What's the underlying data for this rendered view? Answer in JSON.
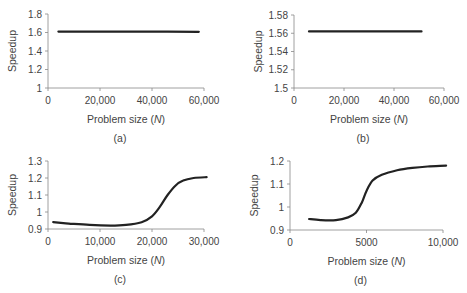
{
  "chart_data": [
    {
      "id": "a",
      "type": "line",
      "panel_label": "(a)",
      "title": "",
      "xlabel": "Problem size (N)",
      "ylabel": "Speedup",
      "xlim": [
        0,
        60000
      ],
      "ylim": [
        1,
        1.8
      ],
      "xticks": [
        0,
        20000,
        40000,
        60000
      ],
      "xtick_labels": [
        "0",
        "20,000",
        "40,000",
        "60,000"
      ],
      "yticks": [
        1,
        1.2,
        1.4,
        1.6,
        1.8
      ],
      "ytick_labels": [
        "1",
        "1.2",
        "1.4",
        "1.6",
        "1.8"
      ],
      "grid": false,
      "series": [
        {
          "name": "Speedup",
          "x": [
            4000,
            20000,
            40000,
            58000
          ],
          "y": [
            1.61,
            1.61,
            1.61,
            1.608
          ]
        }
      ],
      "box": {
        "left": 48,
        "top": 14,
        "width": 156,
        "height": 74
      }
    },
    {
      "id": "b",
      "type": "line",
      "panel_label": "(b)",
      "title": "",
      "xlabel": "Problem size (N)",
      "ylabel": "Speedup",
      "xlim": [
        0,
        60000
      ],
      "ylim": [
        1.5,
        1.58
      ],
      "xticks": [
        0,
        20000,
        40000,
        60000
      ],
      "xtick_labels": [
        "0",
        "20,000",
        "40,000",
        "60,000"
      ],
      "yticks": [
        1.5,
        1.52,
        1.54,
        1.56,
        1.58
      ],
      "ytick_labels": [
        "1.5",
        "1.52",
        "1.54",
        "1.56",
        "1.58"
      ],
      "grid": false,
      "series": [
        {
          "name": "Speedup",
          "x": [
            6000,
            20000,
            40000,
            51000
          ],
          "y": [
            1.562,
            1.562,
            1.562,
            1.562
          ]
        }
      ],
      "box": {
        "left": 294,
        "top": 15,
        "width": 150,
        "height": 73
      }
    },
    {
      "id": "c",
      "type": "line",
      "panel_label": "(c)",
      "title": "",
      "xlabel": "Problem size (N)",
      "ylabel": "Speedup",
      "xlim": [
        0,
        30000
      ],
      "ylim": [
        0.9,
        1.3
      ],
      "xticks": [
        0,
        10000,
        20000,
        30000
      ],
      "xtick_labels": [
        "0",
        "10,000",
        "20,000",
        "30,000"
      ],
      "yticks": [
        0.9,
        1,
        1.1,
        1.2,
        1.3
      ],
      "ytick_labels": [
        "0.9",
        "1",
        "1.1",
        "1.2",
        "1.3"
      ],
      "grid": false,
      "series": [
        {
          "name": "Speedup",
          "x": [
            1000,
            4000,
            8000,
            12000,
            15000,
            18000,
            20000,
            21500,
            23000,
            24500,
            26000,
            28000,
            30500
          ],
          "y": [
            0.94,
            0.932,
            0.924,
            0.92,
            0.924,
            0.94,
            0.975,
            1.03,
            1.1,
            1.155,
            1.185,
            1.2,
            1.205
          ]
        }
      ],
      "box": {
        "left": 48,
        "top": 161,
        "width": 156,
        "height": 68
      }
    },
    {
      "id": "d",
      "type": "line",
      "panel_label": "(d)",
      "title": "",
      "xlabel": "Problem size (N)",
      "ylabel": "Speedup",
      "xlim": [
        0,
        10000
      ],
      "ylim": [
        0.9,
        1.2
      ],
      "xticks": [
        0,
        5000,
        10000
      ],
      "xtick_labels": [
        "0",
        "5000",
        "10,000"
      ],
      "yticks": [
        0.9,
        1,
        1.1,
        1.2
      ],
      "ytick_labels": [
        "0.9",
        "1",
        "1.1",
        "1.2"
      ],
      "grid": false,
      "series": [
        {
          "name": "Speedup",
          "x": [
            1250,
            2000,
            3000,
            3800,
            4300,
            4700,
            5000,
            5400,
            6000,
            7000,
            8000,
            9000,
            10200
          ],
          "y": [
            0.948,
            0.943,
            0.943,
            0.955,
            0.975,
            1.02,
            1.07,
            1.115,
            1.14,
            1.16,
            1.17,
            1.176,
            1.18
          ]
        }
      ],
      "box": {
        "left": 290,
        "top": 161,
        "width": 153,
        "height": 69
      }
    }
  ]
}
